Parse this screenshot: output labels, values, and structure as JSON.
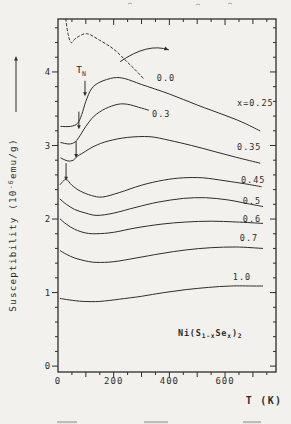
{
  "figure": {
    "y_axis_label": {
      "prefix": "Susceptibility (10",
      "superscript": "-6",
      "suffix": "emu/g)"
    },
    "x_axis_label": "T (K)",
    "x_tick_labels": [
      "0",
      "200",
      "400",
      "600"
    ],
    "y_tick_labels": [
      "0",
      "1",
      "2",
      "3",
      "4"
    ],
    "tn_marker": {
      "base": "T",
      "subscript": "N"
    },
    "formula_segments": [
      [
        "Ni(S",
        "n"
      ],
      [
        "1-x",
        "s"
      ],
      [
        "Se",
        "n"
      ],
      [
        "x",
        "s"
      ],
      [
        ")",
        "n"
      ],
      [
        "2",
        "s"
      ]
    ]
  },
  "chart_data": {
    "type": "line",
    "title": "",
    "xlabel": "T (K)",
    "ylabel": "Susceptibility (10^-6 emu/g)",
    "xlim": [
      0,
      783
    ],
    "ylim": [
      -0.08,
      4.72
    ],
    "x_major_ticks": [
      0,
      200,
      400,
      600
    ],
    "x_minor_step": 50,
    "y_major_ticks": [
      0,
      1,
      2,
      3,
      4
    ],
    "y_minor_step": 0.2,
    "grid": false,
    "legend_position": "inline-right",
    "series": [
      {
        "name": "0.0",
        "label": "0.0",
        "style": "dashed",
        "label_pos": [
          355,
          3.92
        ],
        "points": [
          [
            28,
            4.72
          ],
          [
            36,
            4.52
          ],
          [
            47,
            4.4
          ],
          [
            65,
            4.46
          ],
          [
            103,
            4.52
          ],
          [
            150,
            4.43
          ],
          [
            200,
            4.31
          ],
          [
            250,
            4.13
          ],
          [
            285,
            4.0
          ],
          [
            310,
            3.9
          ]
        ]
      },
      {
        "name": "0.25",
        "label": "x=0.25",
        "style": "solid",
        "label_pos": [
          643,
          3.58
        ],
        "points": [
          [
            10,
            3.26
          ],
          [
            45,
            3.26
          ],
          [
            70,
            3.3
          ],
          [
            85,
            3.42
          ],
          [
            100,
            3.6
          ],
          [
            120,
            3.77
          ],
          [
            150,
            3.86
          ],
          [
            200,
            3.92
          ],
          [
            240,
            3.91
          ],
          [
            300,
            3.83
          ],
          [
            400,
            3.7
          ],
          [
            500,
            3.55
          ],
          [
            600,
            3.41
          ],
          [
            660,
            3.32
          ],
          [
            725,
            3.2
          ]
        ]
      },
      {
        "name": "0.3",
        "label": "0.3",
        "style": "solid",
        "label_pos": [
          338,
          3.43
        ],
        "points": [
          [
            10,
            3.04
          ],
          [
            40,
            3.02
          ],
          [
            62,
            3.05
          ],
          [
            80,
            3.14
          ],
          [
            100,
            3.26
          ],
          [
            130,
            3.4
          ],
          [
            170,
            3.5
          ],
          [
            215,
            3.56
          ],
          [
            250,
            3.56
          ],
          [
            290,
            3.52
          ],
          [
            325,
            3.48
          ]
        ]
      },
      {
        "name": "0.35",
        "label": "0.35",
        "style": "solid",
        "label_pos": [
          643,
          2.98
        ],
        "points": [
          [
            10,
            2.83
          ],
          [
            35,
            2.79
          ],
          [
            55,
            2.8
          ],
          [
            68,
            2.85
          ],
          [
            90,
            2.9
          ],
          [
            130,
            2.99
          ],
          [
            180,
            3.06
          ],
          [
            250,
            3.11
          ],
          [
            330,
            3.12
          ],
          [
            400,
            3.07
          ],
          [
            480,
            3.0
          ],
          [
            560,
            2.92
          ],
          [
            640,
            2.84
          ],
          [
            725,
            2.76
          ]
        ]
      },
      {
        "name": "0.45",
        "label": "0.45",
        "style": "solid",
        "label_pos": [
          657,
          2.53
        ],
        "points": [
          [
            8,
            2.47
          ],
          [
            20,
            2.52
          ],
          [
            31,
            2.54
          ],
          [
            50,
            2.46
          ],
          [
            80,
            2.38
          ],
          [
            120,
            2.32
          ],
          [
            160,
            2.3
          ],
          [
            220,
            2.36
          ],
          [
            300,
            2.46
          ],
          [
            380,
            2.53
          ],
          [
            450,
            2.56
          ],
          [
            520,
            2.56
          ],
          [
            600,
            2.52
          ],
          [
            670,
            2.48
          ],
          [
            730,
            2.44
          ]
        ]
      },
      {
        "name": "0.5",
        "label": "0.5",
        "style": "solid",
        "label_pos": [
          664,
          2.24
        ],
        "points": [
          [
            8,
            2.27
          ],
          [
            30,
            2.2
          ],
          [
            60,
            2.13
          ],
          [
            100,
            2.08
          ],
          [
            140,
            2.05
          ],
          [
            200,
            2.08
          ],
          [
            280,
            2.16
          ],
          [
            360,
            2.23
          ],
          [
            450,
            2.28
          ],
          [
            530,
            2.29
          ],
          [
            610,
            2.26
          ],
          [
            680,
            2.21
          ],
          [
            735,
            2.17
          ]
        ]
      },
      {
        "name": "0.6",
        "label": "0.6",
        "style": "solid",
        "label_pos": [
          664,
          2.0
        ],
        "points": [
          [
            8,
            2.0
          ],
          [
            30,
            1.93
          ],
          [
            60,
            1.86
          ],
          [
            100,
            1.81
          ],
          [
            140,
            1.8
          ],
          [
            200,
            1.82
          ],
          [
            280,
            1.88
          ],
          [
            370,
            1.93
          ],
          [
            460,
            1.96
          ],
          [
            550,
            1.97
          ],
          [
            640,
            1.96
          ],
          [
            735,
            1.94
          ]
        ]
      },
      {
        "name": "0.7",
        "label": "0.7",
        "style": "solid",
        "label_pos": [
          653,
          1.74
        ],
        "points": [
          [
            8,
            1.57
          ],
          [
            30,
            1.52
          ],
          [
            60,
            1.47
          ],
          [
            100,
            1.43
          ],
          [
            140,
            1.41
          ],
          [
            200,
            1.42
          ],
          [
            280,
            1.47
          ],
          [
            370,
            1.53
          ],
          [
            460,
            1.58
          ],
          [
            550,
            1.61
          ],
          [
            640,
            1.62
          ],
          [
            735,
            1.6
          ]
        ]
      },
      {
        "name": "1.0",
        "label": "1.0",
        "style": "solid",
        "label_pos": [
          628,
          1.21
        ],
        "points": [
          [
            8,
            0.92
          ],
          [
            40,
            0.9
          ],
          [
            90,
            0.88
          ],
          [
            150,
            0.88
          ],
          [
            220,
            0.91
          ],
          [
            300,
            0.95
          ],
          [
            380,
            1.0
          ],
          [
            460,
            1.04
          ],
          [
            540,
            1.07
          ],
          [
            620,
            1.09
          ],
          [
            700,
            1.09
          ],
          [
            735,
            1.09
          ]
        ]
      }
    ],
    "tn_arrows": [
      {
        "T": 97,
        "chi_from": 3.88,
        "chi_to": 3.67
      },
      {
        "T": 75,
        "chi_from": 3.46,
        "chi_to": 3.22
      },
      {
        "T": 65,
        "chi_from": 3.06,
        "chi_to": 2.83
      },
      {
        "T": 29,
        "chi_from": 2.76,
        "chi_to": 2.52
      }
    ],
    "tn_label_pos": [
      83,
      4.02
    ],
    "curved_arrow": {
      "from": [
        223,
        4.14
      ],
      "ctrl": [
        323,
        4.4
      ],
      "to": [
        398,
        4.3
      ]
    },
    "formula_pos": [
      431,
      0.45
    ]
  },
  "colors": {
    "ink": "#2e2d2b",
    "paper": "#f2f1ee",
    "faint": "#a9a79f"
  },
  "scan_artifacts": {
    "top": [
      [
        128,
        3
      ],
      [
        196,
        4
      ],
      [
        228,
        3
      ]
    ],
    "bottom": [
      [
        57,
        421,
        20
      ],
      [
        144,
        421,
        24
      ],
      [
        243,
        421,
        18
      ]
    ]
  }
}
